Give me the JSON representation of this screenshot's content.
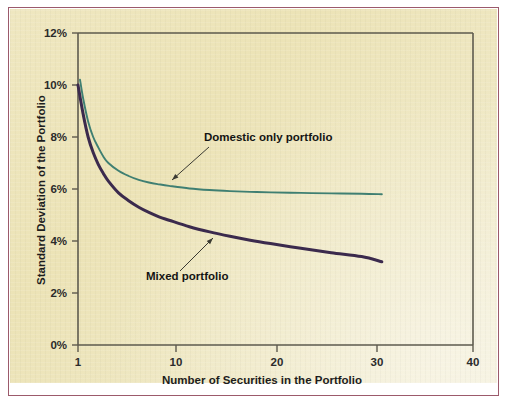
{
  "figure": {
    "background_color": "#ffffff",
    "panel_color": "#ece3b6",
    "frame_color": "#9c5a6b"
  },
  "chart_data": {
    "type": "line",
    "title": "",
    "xlabel": "Number of Securities in the Portfolio",
    "ylabel": "Standard Deviation of the Portfolio",
    "xlim": [
      1,
      40
    ],
    "ylim": [
      0,
      12
    ],
    "grid": false,
    "legend_position": "inline-annotations",
    "xticks": [
      1,
      10,
      20,
      30,
      40
    ],
    "xtick_labels": [
      "1",
      "10",
      "20",
      "30",
      "40"
    ],
    "yticks": [
      0,
      2,
      4,
      6,
      8,
      10,
      12
    ],
    "ytick_labels": [
      "0%",
      "2%",
      "4%",
      "6%",
      "8%",
      "10%",
      "12%"
    ],
    "series": [
      {
        "name": "Domestic only portfolio",
        "color": "#3f7f72",
        "x": [
          1.2,
          1.5,
          2,
          2.5,
          3,
          3.5,
          4,
          5,
          6,
          7,
          8,
          9,
          10,
          12,
          14,
          16,
          18,
          20,
          23,
          26,
          29,
          31
        ],
        "values": [
          10.2,
          9.5,
          8.6,
          8.0,
          7.6,
          7.25,
          7.0,
          6.7,
          6.5,
          6.35,
          6.25,
          6.18,
          6.12,
          6.02,
          5.96,
          5.92,
          5.89,
          5.87,
          5.85,
          5.83,
          5.82,
          5.8
        ]
      },
      {
        "name": "Mixed portfolio",
        "color": "#3b2a4d",
        "x": [
          1,
          1.5,
          2,
          2.5,
          3,
          3.5,
          4,
          5,
          6,
          7,
          8,
          9,
          10,
          12,
          14,
          16,
          18,
          20,
          23,
          26,
          29,
          31
        ],
        "values": [
          10.0,
          8.9,
          8.0,
          7.4,
          6.95,
          6.6,
          6.3,
          5.85,
          5.55,
          5.3,
          5.1,
          4.93,
          4.8,
          4.55,
          4.35,
          4.18,
          4.03,
          3.9,
          3.72,
          3.55,
          3.4,
          3.2
        ]
      }
    ],
    "annotations": [
      {
        "label": "Domestic only portfolio",
        "text_x": 204,
        "text_y": 141,
        "leader_from_x": 209,
        "leader_from_y": 147,
        "leader_to_x": 172,
        "leader_to_y": 180
      },
      {
        "label": "Mixed portfolio",
        "text_x": 146,
        "text_y": 280,
        "leader_from_x": 180,
        "leader_from_y": 271,
        "leader_to_x": 213,
        "leader_to_y": 238
      }
    ]
  }
}
